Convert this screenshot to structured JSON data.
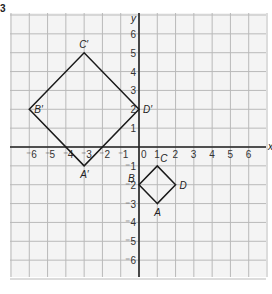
{
  "question_number": "3",
  "axes": {
    "x_label": "x",
    "y_label": "y",
    "x_range": [
      -7,
      7
    ],
    "y_range": [
      -7,
      7
    ],
    "x_ticks": [
      "-6",
      "-5",
      "-4",
      "-3",
      "-2",
      "-1",
      "0",
      "1",
      "2",
      "3",
      "4",
      "5",
      "6"
    ],
    "y_ticks": [
      "6",
      "5",
      "4",
      "3",
      "2",
      "1",
      "-1",
      "-2",
      "-3",
      "-4",
      "-5",
      "-6"
    ],
    "grid": true
  },
  "shapes": [
    {
      "name": "ABCD",
      "vertices": [
        {
          "label": "A",
          "x": 1,
          "y": -3
        },
        {
          "label": "B",
          "x": 0,
          "y": -2
        },
        {
          "label": "C",
          "x": 1,
          "y": -1
        },
        {
          "label": "D",
          "x": 2,
          "y": -2
        }
      ]
    },
    {
      "name": "A'B'C'D'",
      "vertices": [
        {
          "label": "A′",
          "x": -3,
          "y": -1
        },
        {
          "label": "B′",
          "x": -6,
          "y": 2
        },
        {
          "label": "C′",
          "x": -3,
          "y": 5
        },
        {
          "label": "D′",
          "x": 0,
          "y": 2
        }
      ]
    }
  ],
  "colors": {
    "grid": "#b9b9b9",
    "axis": "#222222",
    "shape": "#1a1a1a",
    "background": "#f4f4f4"
  }
}
